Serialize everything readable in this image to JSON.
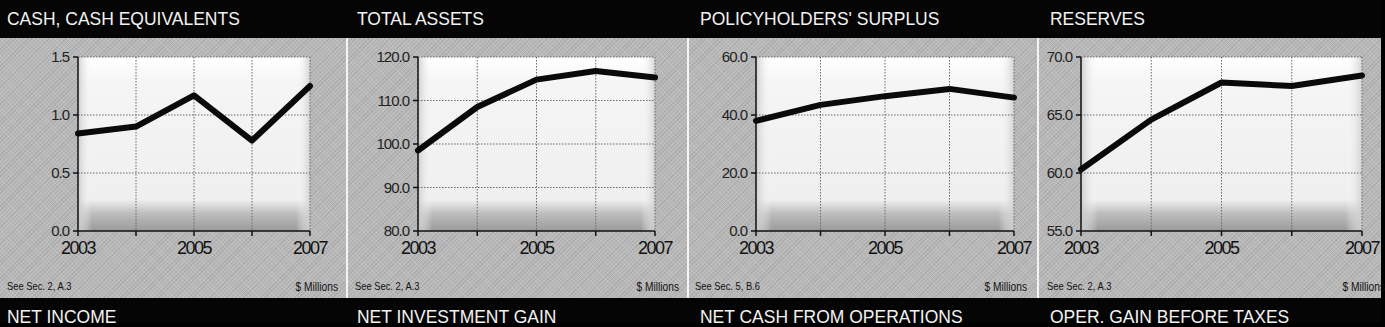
{
  "panels": [
    {
      "title": "CASH, CASH EQUIVALENTS",
      "note": "See Sec. 2, A.3",
      "units": "$ Millions",
      "y_ticks": [
        "1.5",
        "1.0",
        "0.5",
        "0.0"
      ],
      "x_ticks": [
        "2003",
        "2005",
        "2007"
      ]
    },
    {
      "title": "TOTAL ASSETS",
      "note": "See Sec. 2, A.3",
      "units": "$ Millions",
      "y_ticks": [
        "120.0",
        "110.0",
        "100.0",
        "90.0",
        "80.0"
      ],
      "x_ticks": [
        "2003",
        "2005",
        "2007"
      ]
    },
    {
      "title": "POLICYHOLDERS' SURPLUS",
      "note": "See Sec. 5, B.6",
      "units": "$ Millions",
      "y_ticks": [
        "60.0",
        "40.0",
        "20.0",
        "0.0"
      ],
      "x_ticks": [
        "2003",
        "2005",
        "2007"
      ]
    },
    {
      "title": "RESERVES",
      "note": "See Sec. 2, A.3",
      "units": "$ Millions",
      "y_ticks": [
        "70.0",
        "65.0",
        "60.0",
        "55.0"
      ],
      "x_ticks": [
        "2003",
        "2005",
        "2007"
      ]
    }
  ],
  "next_row_titles": [
    "NET INCOME",
    "NET INVESTMENT GAIN",
    "NET CASH FROM OPERATIONS",
    "OPER. GAIN BEFORE TAXES"
  ],
  "colors": {
    "header_bg": "#050505",
    "header_text": "#f2f2f2",
    "panel_bg": "#b9b9b9",
    "plot_bg": "#f3f3f3",
    "line": "#0a0a0a",
    "divider": "#f4f4f4"
  },
  "chart_data": [
    {
      "type": "line",
      "title": "CASH, CASH EQUIVALENTS",
      "x": [
        2003,
        2004,
        2005,
        2006,
        2007
      ],
      "series": [
        {
          "name": "Cash, Cash Equivalents",
          "values": [
            0.84,
            0.9,
            1.17,
            0.78,
            1.25
          ]
        }
      ],
      "xlabel": "",
      "ylabel": "$ Millions",
      "ylim": [
        0.0,
        1.5
      ],
      "y_ticks": [
        0.0,
        0.5,
        1.0,
        1.5
      ],
      "x_tick_labels": [
        "2003",
        "2005",
        "2007"
      ],
      "grid": true,
      "annotation": "See Sec. 2, A.3"
    },
    {
      "type": "line",
      "title": "TOTAL ASSETS",
      "x": [
        2003,
        2004,
        2005,
        2006,
        2007
      ],
      "series": [
        {
          "name": "Total Assets",
          "values": [
            98.5,
            108.5,
            114.8,
            116.8,
            115.3
          ]
        }
      ],
      "xlabel": "",
      "ylabel": "$ Millions",
      "ylim": [
        80.0,
        120.0
      ],
      "y_ticks": [
        80.0,
        90.0,
        100.0,
        110.0,
        120.0
      ],
      "x_tick_labels": [
        "2003",
        "2005",
        "2007"
      ],
      "grid": true,
      "annotation": "See Sec. 2, A.3"
    },
    {
      "type": "line",
      "title": "POLICYHOLDERS' SURPLUS",
      "x": [
        2003,
        2004,
        2005,
        2006,
        2007
      ],
      "series": [
        {
          "name": "Policyholders' Surplus",
          "values": [
            38.0,
            43.5,
            46.5,
            49.0,
            46.0
          ]
        }
      ],
      "xlabel": "",
      "ylabel": "$ Millions",
      "ylim": [
        0.0,
        60.0
      ],
      "y_ticks": [
        0.0,
        20.0,
        40.0,
        60.0
      ],
      "x_tick_labels": [
        "2003",
        "2005",
        "2007"
      ],
      "grid": true,
      "annotation": "See Sec. 5, B.6"
    },
    {
      "type": "line",
      "title": "RESERVES",
      "x": [
        2003,
        2004,
        2005,
        2006,
        2007
      ],
      "series": [
        {
          "name": "Reserves",
          "values": [
            60.3,
            64.6,
            67.8,
            67.5,
            68.4
          ]
        }
      ],
      "xlabel": "",
      "ylabel": "$ Millions",
      "ylim": [
        55.0,
        70.0
      ],
      "y_ticks": [
        55.0,
        60.0,
        65.0,
        70.0
      ],
      "x_tick_labels": [
        "2003",
        "2005",
        "2007"
      ],
      "grid": true,
      "annotation": "See Sec. 2, A.3"
    }
  ]
}
